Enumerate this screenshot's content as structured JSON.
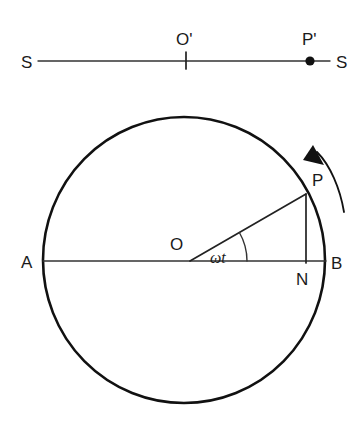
{
  "figure": {
    "background_color": "#ffffff",
    "ink_color": "#111111",
    "width": 360,
    "height": 422
  },
  "projection_line": {
    "name": "screen-line",
    "left_end_label": "S",
    "right_end_label": "S",
    "center_label": "O'",
    "point_label": "P'",
    "center_tick": "|",
    "geometry": {
      "x1": 38,
      "x2": 330,
      "y": 61,
      "center_x": 186,
      "point_x": 310,
      "point_radius": 4.6,
      "tick_top": 52,
      "tick_bottom": 69
    }
  },
  "circle": {
    "name": "reference-circle",
    "center_label": "O",
    "left_label": "A",
    "right_label": "B",
    "foot_label": "N",
    "particle_label": "P",
    "angle_label": "ωt",
    "geometry": {
      "cx": 184,
      "cy": 260,
      "rx": 141,
      "ry": 143,
      "particle_x": 306,
      "particle_y": 194,
      "foot_x": 306,
      "foot_y": 262,
      "diameter_y": 261,
      "angle_arc_radius": 57,
      "angle_degrees": 30
    }
  },
  "rotation_arrow": {
    "name": "rotation-direction-arrow",
    "direction": "counterclockwise",
    "path": "M 344 212 C 340 188 330 165 316 150",
    "head_points": "316,146 326,166 306,162"
  },
  "labels": {
    "S_left": {
      "text": "S",
      "x": 21,
      "y": 68
    },
    "S_right": {
      "text": "S",
      "x": 336,
      "y": 68
    },
    "O_prime": {
      "text": "O'",
      "x": 176,
      "y": 45
    },
    "P_prime": {
      "text": "P'",
      "x": 302,
      "y": 45
    },
    "A": {
      "text": "A",
      "x": 21,
      "y": 268
    },
    "B": {
      "text": "B",
      "x": 331,
      "y": 269
    },
    "O": {
      "text": "O",
      "x": 170,
      "y": 250
    },
    "N": {
      "text": "N",
      "x": 296,
      "y": 285
    },
    "P": {
      "text": "P",
      "x": 312,
      "y": 186
    },
    "omega_t": {
      "text": "ωt",
      "x": 210,
      "y": 263
    }
  }
}
